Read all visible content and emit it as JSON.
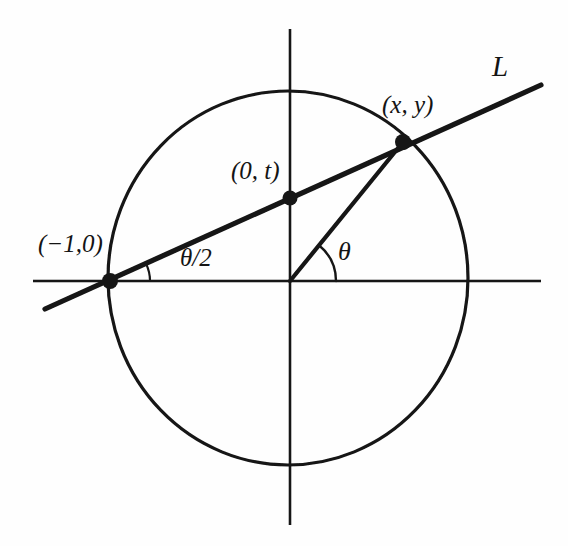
{
  "figure": {
    "kind": "geometry-diagram",
    "background_color": "#fefefe",
    "ink_color": "#141414"
  },
  "labels": {
    "point_on_circle": "(x, y)",
    "line_name": "L",
    "y_intercept": "(0, t)",
    "left_point": "(−1,0)",
    "angle_at_origin": "θ",
    "angle_at_left_point": "θ/2"
  },
  "chart_data": {
    "type": "scatter",
    "title": "",
    "xlabel": "",
    "ylabel": "",
    "grid": false,
    "legend": null,
    "axes": {
      "x_axis": {
        "from_px": [
          33,
          281
        ],
        "to_px": [
          541,
          281
        ],
        "label": ""
      },
      "y_axis": {
        "from_px": [
          290,
          29
        ],
        "to_px": [
          290,
          525
        ],
        "label": ""
      },
      "origin_px": [
        290,
        281
      ]
    },
    "shapes": [
      {
        "name": "unit-circle",
        "type": "ellipse",
        "center_px": [
          288,
          278
        ],
        "rx_px": 180,
        "ry_px": 187,
        "stroke_width": 3.2,
        "fill": "none"
      },
      {
        "name": "secant-line-L",
        "type": "line",
        "from_px": [
          45,
          309
        ],
        "to_px": [
          541,
          85
        ],
        "stroke_width": 5.2
      },
      {
        "name": "radius-to-point",
        "type": "line",
        "from_px": [
          290,
          281
        ],
        "to_px": [
          403,
          142
        ],
        "stroke_width": 4.2
      },
      {
        "name": "angle-arc-theta",
        "type": "arc",
        "center_px": [
          290,
          281
        ],
        "radius_px": 46,
        "start_deg": 0,
        "end_deg": 51,
        "stroke_width": 2.4
      },
      {
        "name": "angle-arc-theta-half",
        "type": "arc",
        "center_px": [
          110,
          281
        ],
        "radius_px": 40,
        "start_deg": 0,
        "end_deg": 25,
        "stroke_width": 2.2
      }
    ],
    "points": [
      {
        "name": "point-on-circle",
        "label": "(x, y)",
        "px": [
          403,
          142
        ],
        "r_px": 8
      },
      {
        "name": "y-intercept",
        "label": "(0, t)",
        "px": [
          290,
          198
        ],
        "r_px": 7.5
      },
      {
        "name": "left-point",
        "label": "(−1,0)",
        "px": [
          110,
          281
        ],
        "r_px": 8
      }
    ]
  }
}
